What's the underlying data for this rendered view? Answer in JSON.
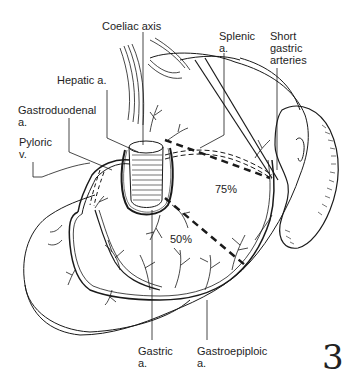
{
  "figure": {
    "number": "3",
    "labels": {
      "coeliac_axis": "Coeliac axis",
      "splenic": [
        "Splenic",
        "a."
      ],
      "short_gastric": [
        "Short",
        "gastric",
        "arteries"
      ],
      "hepatic": "Hepatic a.",
      "gastroduodenal": [
        "Gastroduodenal",
        "a."
      ],
      "pyloric": [
        "Pyloric",
        "v."
      ],
      "gastric": [
        "Gastric",
        "a."
      ],
      "gastroepiploic": [
        "Gastroepiploic",
        "a."
      ]
    },
    "regions": {
      "upper_pct": "75%",
      "lower_pct": "50%"
    },
    "colors": {
      "ink": "#1a1a1a",
      "background": "#ffffff"
    }
  }
}
